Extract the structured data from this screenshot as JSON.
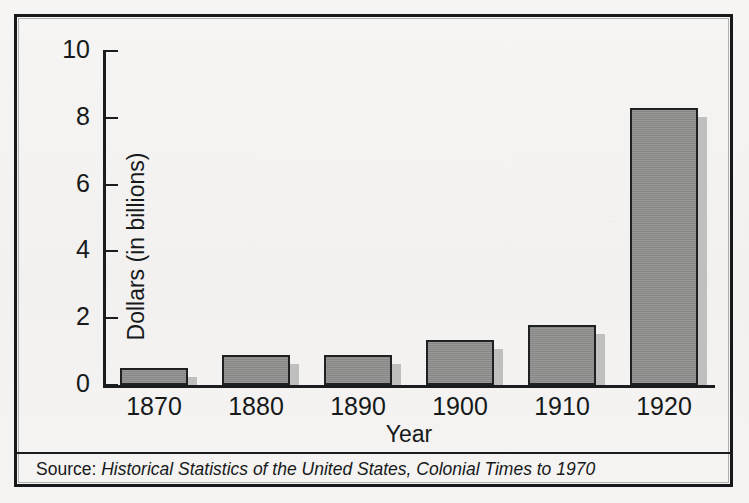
{
  "figure": {
    "source_label": "Source:",
    "source_title": "Historical Statistics of the United States, Colonial Times to 1970"
  },
  "chart_data": {
    "type": "bar",
    "title": "",
    "subtitle": "",
    "xlabel": "Year",
    "ylabel": "Dollars (in billions)",
    "categories": [
      "1870",
      "1880",
      "1890",
      "1900",
      "1910",
      "1920"
    ],
    "values": [
      0.5,
      0.9,
      0.9,
      1.35,
      1.8,
      8.3
    ],
    "series": [
      {
        "name": "Dollars (in billions)",
        "values": [
          0.5,
          0.9,
          0.9,
          1.35,
          1.8,
          8.3
        ]
      }
    ],
    "ylim": [
      0,
      10
    ],
    "ytick_labels": [
      "0",
      "2",
      "4",
      "6",
      "8",
      "10"
    ],
    "ytick_values": [
      0,
      2,
      4,
      6,
      8,
      10
    ],
    "grid": false,
    "legend": "none",
    "bar_fill_color": "#8d8d8b",
    "bar_edge_color": "#1e2022",
    "bar_shadow_color": "#bfbfbd",
    "axis_color": "#1a1c1e",
    "background_color": "#f4f3f1"
  }
}
